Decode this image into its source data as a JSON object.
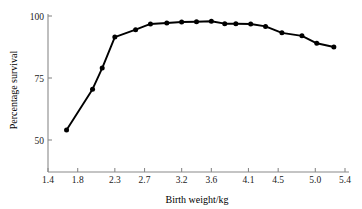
{
  "chart_data": {
    "type": "line",
    "title": "",
    "xlabel": "Birth weight/kg",
    "ylabel": "Percentage survival",
    "xlim": [
      1.4,
      5.4
    ],
    "ylim": [
      38,
      103
    ],
    "grid": false,
    "legend": null,
    "marker": "filled-circle",
    "line_color": "#000000",
    "axis_color": "#8a8a8a",
    "xticks": [
      "1.4",
      "1.8",
      "2.3",
      "2.7",
      "3.2",
      "3.6",
      "4.1",
      "4.5",
      "5.0",
      "5.4"
    ],
    "xtick_values": [
      1.4,
      1.8,
      2.3,
      2.7,
      3.2,
      3.6,
      4.1,
      4.5,
      5.0,
      5.4
    ],
    "yticks": [
      "100",
      "75",
      "50"
    ],
    "ytick_values": [
      100,
      75,
      50
    ],
    "series": [
      {
        "name": "Percentage survival",
        "x": [
          1.65,
          2.0,
          2.13,
          2.3,
          2.58,
          2.78,
          3.0,
          3.2,
          3.4,
          3.6,
          3.78,
          3.93,
          4.13,
          4.33,
          4.55,
          4.82,
          5.02,
          5.25
        ],
        "values": [
          54,
          70.5,
          79,
          91.5,
          94.5,
          96.8,
          97.2,
          97.6,
          97.7,
          97.9,
          96.9,
          96.9,
          96.8,
          95.8,
          93.2,
          92,
          89,
          87.5
        ]
      }
    ]
  }
}
